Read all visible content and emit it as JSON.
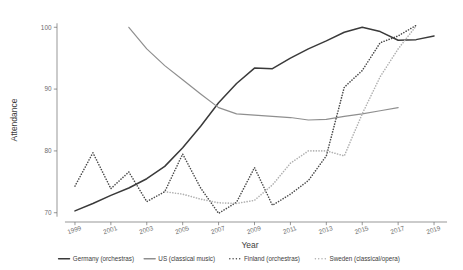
{
  "chart_data": {
    "type": "line",
    "title": "",
    "xlabel": "Year",
    "ylabel": "Attendance",
    "xlim": [
      1998,
      2020
    ],
    "ylim": [
      68.5,
      101.5
    ],
    "xticks": [
      1999,
      2001,
      2003,
      2005,
      2007,
      2009,
      2011,
      2013,
      2015,
      2017,
      2019
    ],
    "xtick_labels": [
      "1999",
      "2001",
      "2003",
      "2005",
      "2007",
      "2009",
      "2011",
      "2013",
      "2015",
      "2017",
      "2019"
    ],
    "yticks": [
      70,
      80,
      90,
      100
    ],
    "ytick_labels": [
      "70",
      "80",
      "90",
      "100"
    ],
    "grid": false,
    "legend_position": "bottom",
    "series": [
      {
        "name": "Germany (orchestras)",
        "style": "solid",
        "color": "#3a3a3a",
        "width": 1.5,
        "x": [
          1999,
          2000,
          2001,
          2002,
          2003,
          2004,
          2005,
          2006,
          2007,
          2008,
          2009,
          2010,
          2011,
          2012,
          2013,
          2014,
          2015,
          2016,
          2017,
          2018,
          2019
        ],
        "y": [
          70.3,
          71.5,
          72.8,
          74.0,
          75.5,
          77.5,
          80.5,
          84.0,
          87.8,
          90.9,
          93.4,
          93.3,
          95.0,
          96.5,
          97.8,
          99.2,
          100.0,
          99.3,
          97.9,
          98.0,
          98.6
        ]
      },
      {
        "name": "US (classical music)",
        "style": "solid",
        "color": "#8f8f8f",
        "width": 1.2,
        "x": [
          2002,
          2003,
          2004,
          2005,
          2006,
          2007,
          2008,
          2009,
          2010,
          2011,
          2012,
          2013,
          2014,
          2015,
          2016,
          2017
        ],
        "y": [
          100.0,
          96.5,
          93.8,
          91.5,
          89.2,
          87.0,
          86.0,
          85.8,
          85.6,
          85.4,
          85.0,
          85.1,
          85.6,
          86.0,
          86.5,
          87.0
        ]
      },
      {
        "name": "Finland (orchestras)",
        "style": "dotted",
        "color": "#4a4a4a",
        "width": 1.3,
        "x": [
          1999,
          2000,
          2001,
          2002,
          2003,
          2004,
          2005,
          2006,
          2007,
          2008,
          2009,
          2010,
          2011,
          2012,
          2013,
          2014,
          2015,
          2016,
          2017,
          2018
        ],
        "y": [
          74.3,
          79.7,
          73.9,
          76.6,
          71.8,
          73.4,
          79.5,
          74.0,
          69.9,
          71.7,
          77.3,
          71.2,
          73.0,
          75.2,
          79.2,
          90.3,
          93.0,
          97.5,
          98.6,
          100.3
        ]
      },
      {
        "name": "Sweden (classical/opera)",
        "style": "dotted",
        "color": "#b0b0b0",
        "width": 1.3,
        "x": [
          2004,
          2005,
          2006,
          2007,
          2008,
          2009,
          2010,
          2011,
          2012,
          2013,
          2014,
          2015,
          2016,
          2017,
          2018
        ],
        "y": [
          73.4,
          73.0,
          72.2,
          71.6,
          71.5,
          72.0,
          74.5,
          78.0,
          80.0,
          80.0,
          79.2,
          86.0,
          92.0,
          96.5,
          100.2
        ]
      }
    ]
  },
  "legend": {
    "items": [
      {
        "label": "Germany (orchestras)",
        "style": "solid",
        "color": "#3a3a3a"
      },
      {
        "label": "US (classical music)",
        "style": "solid",
        "color": "#8f8f8f"
      },
      {
        "label": "Finland (orchestras)",
        "style": "dotted",
        "color": "#4a4a4a"
      },
      {
        "label": "Sweden (classical/opera)",
        "style": "dotted",
        "color": "#b0b0b0"
      }
    ]
  },
  "axis": {
    "x_title": "Year",
    "y_title": "Attendance",
    "axis_color": "#6b6b6b"
  }
}
